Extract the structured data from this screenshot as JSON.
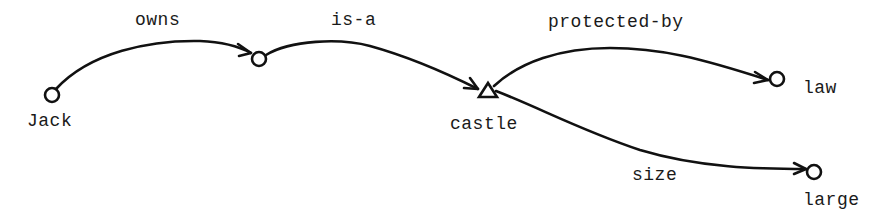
{
  "diagram": {
    "type": "semantic-network",
    "nodes": [
      {
        "id": "jack",
        "label": "Jack",
        "shape": "circle"
      },
      {
        "id": "unnamed",
        "label": "",
        "shape": "circle"
      },
      {
        "id": "castle",
        "label": "castle",
        "shape": "triangle"
      },
      {
        "id": "law",
        "label": "law",
        "shape": "circle"
      },
      {
        "id": "large",
        "label": "large",
        "shape": "circle"
      }
    ],
    "edges": [
      {
        "from": "jack",
        "to": "unnamed",
        "label": "owns"
      },
      {
        "from": "unnamed",
        "to": "castle",
        "label": "is-a"
      },
      {
        "from": "castle",
        "to": "law",
        "label": "protected-by"
      },
      {
        "from": "castle",
        "to": "large",
        "label": "size"
      }
    ]
  },
  "colors": {
    "ink": "#111111",
    "background": "#ffffff"
  }
}
